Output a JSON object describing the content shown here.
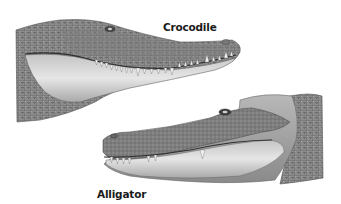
{
  "labels": {
    "crocodile": "Crocodile",
    "alligator": "Alligator"
  },
  "figures": [
    {
      "name": "crocodile-head",
      "facing": "right",
      "label": "Crocodile"
    },
    {
      "name": "alligator-head",
      "facing": "left",
      "label": "Alligator"
    }
  ],
  "colors": {
    "background": "#ffffff",
    "skin_dark": "#6f6f6f",
    "skin_mid": "#9a9a9a",
    "jaw_light": "#d8d8d8",
    "teeth": "#f4f4f4",
    "label_text": "#1a1a1a"
  }
}
